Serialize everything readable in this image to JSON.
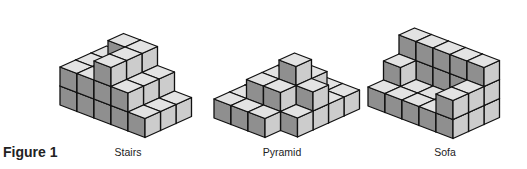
{
  "figure": {
    "label": "Figure 1"
  },
  "style": {
    "top_color": "#e3e3e3",
    "left_color": "#8f8f8f",
    "right_color": "#cccccc",
    "stroke_color": "#111111"
  },
  "projection": {
    "a": [
      17,
      6.5
    ],
    "b": [
      15.5,
      -7
    ],
    "u": [
      0,
      -19
    ]
  },
  "shapes": [
    {
      "name": "stairs",
      "label": "Stairs",
      "label_x": 128,
      "origin": [
        60,
        105
      ],
      "heights": [
        [
          2,
          2,
          2
        ],
        [
          2,
          2,
          3
        ],
        [
          3,
          3,
          3
        ],
        [
          2,
          2,
          2
        ],
        [
          1,
          1,
          1
        ]
      ]
    },
    {
      "name": "pyramid",
      "label": "Pyramid",
      "label_x": 282,
      "origin": [
        214,
        118
      ],
      "heights": [
        [
          1,
          1,
          1,
          1,
          1
        ],
        [
          1,
          2,
          2,
          2,
          1
        ],
        [
          1,
          2,
          3,
          2,
          1
        ],
        [
          0,
          1,
          2,
          1,
          1
        ]
      ]
    },
    {
      "name": "sofa",
      "label": "Sofa",
      "label_x": 445,
      "origin": [
        368,
        106
      ],
      "heights": [
        [
          1,
          2,
          3
        ],
        [
          1,
          1,
          3
        ],
        [
          1,
          1,
          3
        ],
        [
          1,
          1,
          3
        ],
        [
          2,
          2,
          3
        ]
      ]
    }
  ]
}
